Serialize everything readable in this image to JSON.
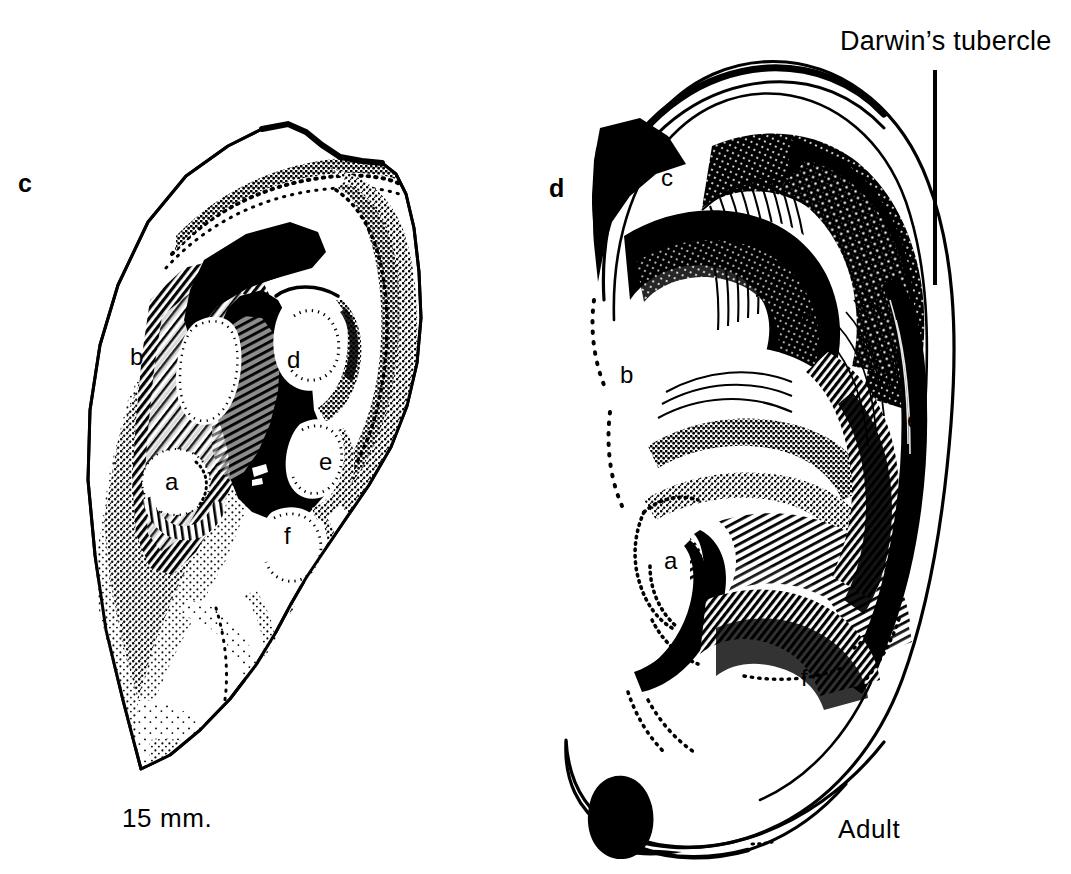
{
  "figure": {
    "title_internal": "Development of the auricle: 15 mm embryo and adult",
    "background_color": "#ffffff",
    "ink_color": "#000000"
  },
  "annotations": {
    "darwins_tubercle_label": "Darwin’s tubercle"
  },
  "panels": [
    {
      "id": "panel-c",
      "letter": "c",
      "caption": "15 mm.",
      "hillocks": [
        {
          "key": "a",
          "label": "a"
        },
        {
          "key": "b",
          "label": "b"
        },
        {
          "key": "c",
          "label": "c"
        },
        {
          "key": "d",
          "label": "d"
        },
        {
          "key": "e",
          "label": "e"
        },
        {
          "key": "f",
          "label": "f"
        }
      ]
    },
    {
      "id": "panel-d",
      "letter": "d",
      "caption": "Adult",
      "hillocks": [
        {
          "key": "a",
          "label": "a"
        },
        {
          "key": "b",
          "label": "b"
        },
        {
          "key": "c",
          "label": "c"
        },
        {
          "key": "d",
          "label": "d"
        },
        {
          "key": "e",
          "label": "e"
        },
        {
          "key": "f",
          "label": "f"
        }
      ]
    }
  ]
}
